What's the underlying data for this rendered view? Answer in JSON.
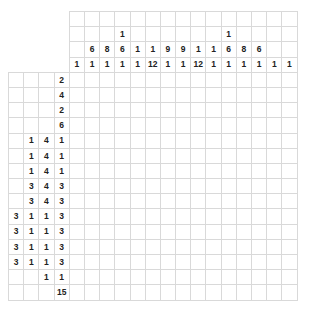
{
  "puzzle": {
    "type": "nonogram",
    "size": {
      "cols": 15,
      "rows": 15
    },
    "column_clue_rows": 4,
    "row_clue_cols": 4,
    "columns": [
      {
        "clues": [
          "",
          "",
          "",
          "1"
        ]
      },
      {
        "clues": [
          "",
          "",
          "6",
          "1"
        ]
      },
      {
        "clues": [
          "",
          "",
          "8",
          "1"
        ]
      },
      {
        "clues": [
          "",
          "1",
          "6",
          "1"
        ]
      },
      {
        "clues": [
          "",
          "",
          "1",
          "1"
        ]
      },
      {
        "clues": [
          "",
          "",
          "1",
          "12"
        ]
      },
      {
        "clues": [
          "",
          "",
          "9",
          "1"
        ]
      },
      {
        "clues": [
          "",
          "",
          "9",
          "1"
        ]
      },
      {
        "clues": [
          "",
          "",
          "1",
          "12"
        ]
      },
      {
        "clues": [
          "",
          "",
          "1",
          "1"
        ]
      },
      {
        "clues": [
          "",
          "1",
          "6",
          "1"
        ]
      },
      {
        "clues": [
          "",
          "",
          "8",
          "1"
        ]
      },
      {
        "clues": [
          "",
          "",
          "6",
          "1"
        ]
      },
      {
        "clues": [
          "",
          "",
          "",
          "1"
        ]
      },
      {
        "clues": [
          "",
          "",
          "",
          "1"
        ]
      }
    ],
    "rows": [
      {
        "clues": [
          "",
          "",
          "",
          "2"
        ]
      },
      {
        "clues": [
          "",
          "",
          "",
          "4"
        ]
      },
      {
        "clues": [
          "",
          "",
          "",
          "2"
        ]
      },
      {
        "clues": [
          "",
          "",
          "",
          "6"
        ]
      },
      {
        "clues": [
          "",
          "1",
          "4",
          "1"
        ]
      },
      {
        "clues": [
          "",
          "1",
          "4",
          "1"
        ]
      },
      {
        "clues": [
          "",
          "1",
          "4",
          "1"
        ]
      },
      {
        "clues": [
          "",
          "3",
          "4",
          "3"
        ]
      },
      {
        "clues": [
          "",
          "3",
          "4",
          "3"
        ]
      },
      {
        "clues": [
          "3",
          "1",
          "1",
          "3"
        ]
      },
      {
        "clues": [
          "3",
          "1",
          "1",
          "3"
        ]
      },
      {
        "clues": [
          "3",
          "1",
          "1",
          "3"
        ]
      },
      {
        "clues": [
          "3",
          "1",
          "1",
          "3"
        ]
      },
      {
        "clues": [
          "",
          "",
          "1",
          "1"
        ]
      },
      {
        "clues": [
          "",
          "",
          "",
          "15"
        ]
      }
    ]
  },
  "colors": {
    "grid_line": "#d9d9d9",
    "clue_text": "#222222",
    "background": "#ffffff"
  }
}
